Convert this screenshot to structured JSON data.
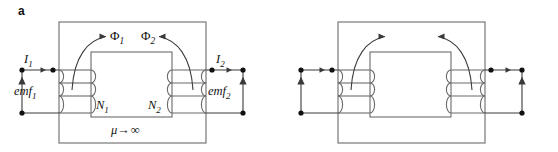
{
  "figure": {
    "type": "diagram",
    "panels": [
      {
        "id": "a",
        "label": "a",
        "core_label_html": "mu -> infinity",
        "core_label": {
          "mu": "μ",
          "arrow": "→",
          "value": "∞"
        },
        "flux": {
          "primary": "Φ",
          "primary_sub": "1",
          "secondary": "Φ",
          "secondary_sub": "2"
        },
        "left_terminal": {
          "current": "I",
          "current_sub": "1",
          "source": "emf",
          "source_sub": "1"
        },
        "right_terminal": {
          "current": "I",
          "current_sub": "2",
          "source": "emf",
          "source_sub": "2"
        },
        "windings": {
          "primary_turns": "N",
          "primary_turns_sub": "1",
          "secondary_turns": "N",
          "secondary_turns_sub": "2"
        }
      },
      {
        "id": "b",
        "label": "b",
        "core_label_html": "mu = mu0 mur",
        "core_label": {
          "mu": "μ",
          "equals": "=",
          "mu0": "μ",
          "mu0_sub": "0",
          "mur": "μ",
          "mur_sub": "r"
        },
        "flux": {
          "primary": "Φ",
          "primary_sub": "1",
          "secondary": "Φ",
          "secondary_sub": "2"
        },
        "left_terminal": {
          "current": "I",
          "current_sub": "1",
          "source": "emf",
          "source_sub": "1"
        },
        "right_terminal": {
          "current": "I",
          "current_sub": "2",
          "source": "emf",
          "source_sub": "2"
        },
        "windings": {
          "primary_turns": "N",
          "primary_turns_sub": "1",
          "secondary_turns": "N",
          "secondary_turns_sub": "2"
        }
      }
    ],
    "colors": {
      "stroke": "#6b6b6b",
      "stroke_dark": "#3a3a3a",
      "text": "#111111",
      "background": "#ffffff"
    }
  }
}
